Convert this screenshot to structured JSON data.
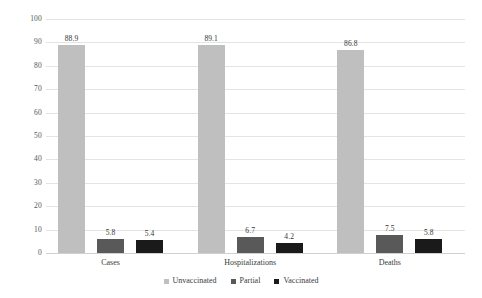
{
  "chart_data": {
    "type": "bar",
    "title": "",
    "subtitle": "",
    "xlabel": "",
    "ylabel": "",
    "ylim": [
      0,
      100
    ],
    "ytick_step": 10,
    "yticks": [
      "0",
      "10",
      "20",
      "30",
      "40",
      "50",
      "60",
      "70",
      "80",
      "90",
      "100"
    ],
    "grid": true,
    "legend_position": "bottom-center",
    "categories": [
      "Cases",
      "Hospitalizations",
      "Deaths"
    ],
    "series": [
      {
        "name": "Unvaccinated",
        "color": "#bfbfbf",
        "values": [
          88.9,
          89.1,
          86.8
        ],
        "labels": [
          "88.9",
          "89.1",
          "86.8"
        ]
      },
      {
        "name": "Partial",
        "color": "#595959",
        "values": [
          5.8,
          6.7,
          7.5
        ],
        "labels": [
          "5.8",
          "6.7",
          "7.5"
        ]
      },
      {
        "name": "Vaccinated",
        "color": "#1a1a1a",
        "values": [
          5.4,
          4.2,
          5.8
        ],
        "labels": [
          "5.4",
          "4.2",
          "5.8"
        ]
      }
    ]
  },
  "colors": {
    "background": "#ffffff",
    "gridline": "#e4e4e4",
    "baseline": "#d0d0d0",
    "text": "#3a3a3a",
    "unvaccinated": "#bfbfbf",
    "partial": "#595959",
    "vaccinated": "#1a1a1a"
  }
}
